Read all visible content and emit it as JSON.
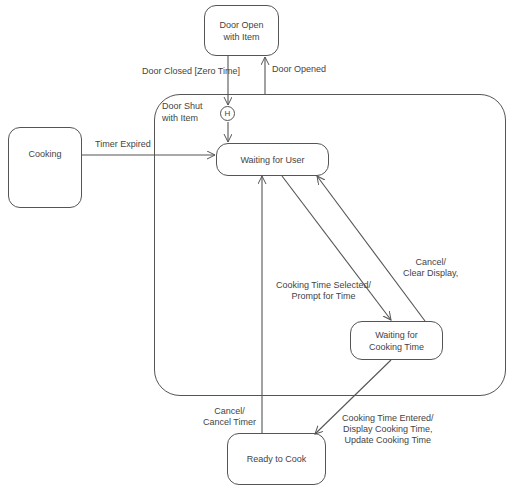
{
  "diagram": {
    "type": "state-machine",
    "states": {
      "door_open": "Door Open with Item",
      "cooking": "Cooking",
      "waiting_user": "Waiting for User",
      "waiting_cooking_time": "Waiting for Cooking Time",
      "ready_to_cook": "Ready to Cook"
    },
    "composite": {
      "label_line1": "Door Shut",
      "label_line2": "with Item",
      "history_symbol": "H"
    },
    "transitions": {
      "door_closed": "Door Closed [Zero Time]",
      "door_opened": "Door Opened",
      "timer_expired": "Timer Expired",
      "cooking_time_selected_line1": "Cooking Time Selected/",
      "cooking_time_selected_line2": "Prompt for Time",
      "cancel_clear_line1": "Cancel/",
      "cancel_clear_line2": "Clear Display,",
      "cooking_time_entered_line1": "Cooking Time Entered/",
      "cooking_time_entered_line2": "Display Cooking Time,",
      "cooking_time_entered_line3": "Update Cooking Time",
      "cancel_timer_line1": "Cancel/",
      "cancel_timer_line2": "Cancel Timer"
    }
  }
}
